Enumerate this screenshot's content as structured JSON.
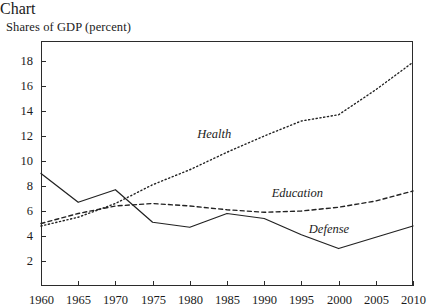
{
  "chart_data": {
    "type": "line",
    "title": "Shares of GDP (percent)",
    "xlabel": "",
    "ylabel": "",
    "grid": false,
    "legend_position": "inline-annotations",
    "x": [
      1960,
      1965,
      1970,
      1975,
      1980,
      1985,
      1990,
      1995,
      2000,
      2005,
      2010
    ],
    "xlim": [
      1960,
      2010
    ],
    "ylim": [
      0,
      19.6
    ],
    "xticks": [
      "1960",
      "1965",
      "1970",
      "1975",
      "1980",
      "1985",
      "1990",
      "1995",
      "2000",
      "2005",
      "2010"
    ],
    "yticks": [
      "2",
      "4",
      "6",
      "8",
      "10",
      "12",
      "14",
      "16",
      "18"
    ],
    "ytick_values": [
      2,
      4,
      6,
      8,
      10,
      12,
      14,
      16,
      18
    ],
    "series": [
      {
        "name": "Health",
        "style": "dotted",
        "values": [
          4.8,
          5.5,
          6.6,
          8.1,
          9.3,
          10.7,
          12.0,
          13.2,
          13.7,
          15.7,
          17.9
        ],
        "label": "Health",
        "label_x": 1981,
        "label_y": 12.1
      },
      {
        "name": "Education",
        "style": "dashed",
        "values": [
          5.0,
          5.8,
          6.4,
          6.6,
          6.4,
          6.1,
          5.9,
          6.0,
          6.3,
          6.8,
          7.6
        ],
        "label": "Education",
        "label_x": 1991,
        "label_y": 7.4
      },
      {
        "name": "Defense",
        "style": "solid",
        "values": [
          9.0,
          6.7,
          7.7,
          5.1,
          4.7,
          5.8,
          5.4,
          4.1,
          3.0,
          3.9,
          4.8
        ],
        "label": "Defense",
        "label_x": 1996,
        "label_y": 4.5
      }
    ]
  },
  "axis": {
    "y_tick_labels": [
      "18",
      "16",
      "14",
      "12",
      "10",
      "8",
      "6",
      "4",
      "2"
    ],
    "x_tick_labels": [
      "1960",
      "1965",
      "1970",
      "1975",
      "1980",
      "1985",
      "1990",
      "1995",
      "2000",
      "2005",
      "2010"
    ]
  },
  "annotations": {
    "health": "Health",
    "education": "Education",
    "defense": "Defense"
  }
}
